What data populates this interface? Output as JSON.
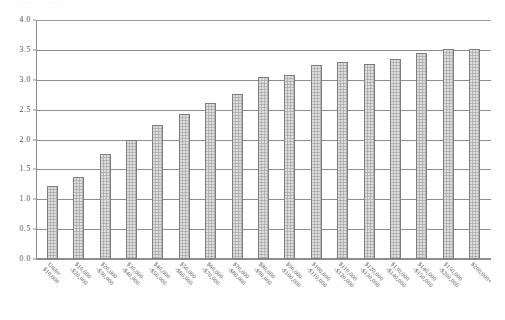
{
  "figure": {
    "title_remnant": "······  ····  ·····        ·      ·                    ·                         ·          ·",
    "background_color": "#ffffff",
    "bar_fill_color": "#b9b9b9",
    "bar_border_color": "#7e7e7e",
    "gridline_color": "#8d8d8d",
    "text_color": "#4a4a4a"
  },
  "chart_data": {
    "type": "bar",
    "title": "",
    "xlabel": "",
    "ylabel": "",
    "ylim": [
      0.0,
      4.0
    ],
    "ytick_labels": [
      "4.0",
      "3.5",
      "3.0",
      "2.5",
      "2.0",
      "1.5",
      "1.0",
      "0.5",
      "0.0"
    ],
    "ytick_values": [
      4.0,
      3.5,
      3.0,
      2.5,
      2.0,
      1.5,
      1.0,
      0.5,
      0.0
    ],
    "grid": true,
    "legend": false,
    "categories": [
      "Under $10,000",
      "$10,000-$20,000",
      "$20,000-$30,000",
      "$30,000-$40,000",
      "$40,000-$50,000",
      "$50,000-$60,000",
      "$60,000-$70,000",
      "$70,000-$80,000",
      "$80,000-$90,000",
      "$90,000-$100,000",
      "$100,000-$110,000",
      "$110,000-$120,000",
      "$120,000-$130,000",
      "$130,000-$140,000",
      "$140,000-$150,000",
      "$150,000-$200,000",
      "$200,000+"
    ],
    "category_lines": [
      [
        "Under",
        "$10,000"
      ],
      [
        "$10,000",
        "-$20,000"
      ],
      [
        "$20,000",
        "-$30,000"
      ],
      [
        "$30,000",
        "-$40,000"
      ],
      [
        "$40,000",
        "-$50,000"
      ],
      [
        "$50,000",
        "-$60,000"
      ],
      [
        "$60,000",
        "-$70,000"
      ],
      [
        "$70,000",
        "-$80,000"
      ],
      [
        "$80,000",
        "-$90,000"
      ],
      [
        "$90,000",
        "-$100,000"
      ],
      [
        "$100,000",
        "-$110,000"
      ],
      [
        "$110,000",
        "-$120,000"
      ],
      [
        "$120,000",
        "-$130,000"
      ],
      [
        "$130,000",
        "-$140,000"
      ],
      [
        "$140,000",
        "-$150,000"
      ],
      [
        "$150,000",
        "-$200,000"
      ],
      [
        "$200,000+"
      ]
    ],
    "values": [
      1.23,
      1.37,
      1.76,
      1.99,
      2.24,
      2.42,
      2.61,
      2.76,
      3.04,
      3.08,
      3.24,
      3.29,
      3.27,
      3.35,
      3.44,
      3.52,
      3.52
    ]
  }
}
